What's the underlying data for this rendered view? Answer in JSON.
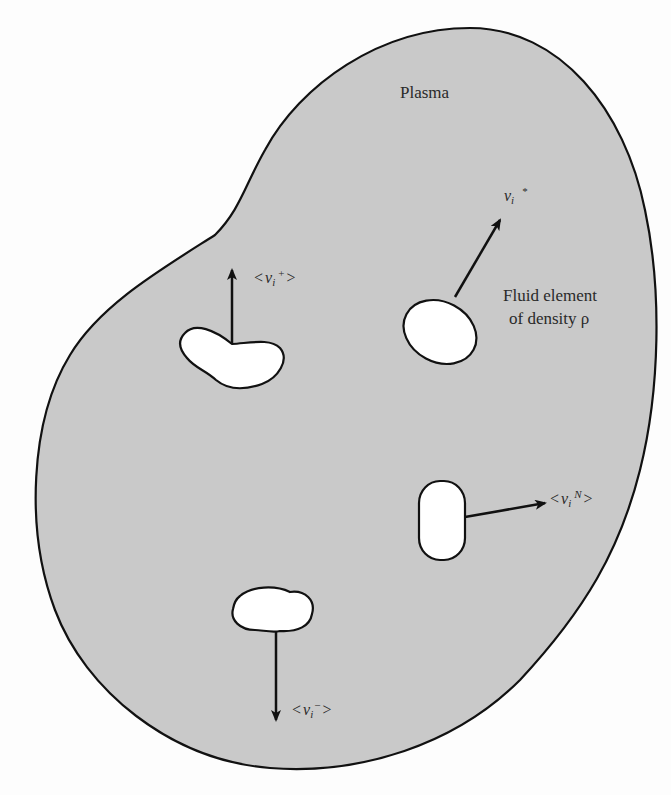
{
  "figure": {
    "colors": {
      "plasma_fill": "#c9c9c9",
      "outline": "#111111",
      "element_fill": "#ffffff",
      "background": "#fdfdfd",
      "text": "#2a2a2a"
    }
  },
  "labels": {
    "plasma": "Plasma",
    "fluid_element_line1": "Fluid element",
    "fluid_element_line2": "of density ρ"
  },
  "vectors": [
    {
      "id": "v-plus",
      "open": "<",
      "symbol": "v",
      "subscript": "i",
      "superscript": "+",
      "close": ">",
      "direction": "up"
    },
    {
      "id": "v-star",
      "open": "",
      "symbol": "v",
      "subscript": "i",
      "superscript": "*",
      "close": "",
      "direction": "up-right"
    },
    {
      "id": "v-N",
      "open": "<",
      "symbol": "v",
      "subscript": "i",
      "superscript": "N",
      "close": ">",
      "direction": "right"
    },
    {
      "id": "v-minus",
      "open": "<",
      "symbol": "v",
      "subscript": "i",
      "superscript": "−",
      "close": ">",
      "direction": "down"
    }
  ]
}
